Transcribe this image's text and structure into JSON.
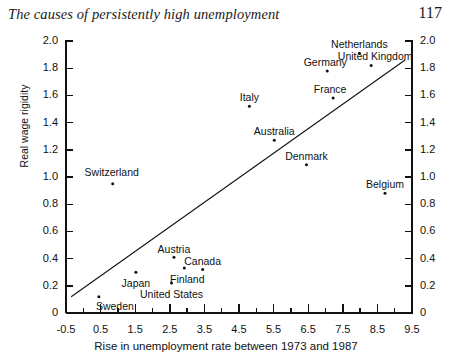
{
  "page": {
    "running_head": "The causes of persistently high unemployment",
    "folio": "117"
  },
  "chart_data": {
    "type": "scatter",
    "title": "",
    "xlabel": "Rise in unemployment rate between 1973 and 1987",
    "ylabel": "Real wage rigidity",
    "xlim": [
      -0.5,
      9.5
    ],
    "ylim": [
      0,
      2.0
    ],
    "xticks": [
      -0.5,
      0.5,
      1.5,
      2.5,
      3.5,
      4.5,
      5.5,
      6.5,
      7.5,
      8.5,
      9.5
    ],
    "xticklabels": [
      "-0.5",
      "0.5",
      "1.5",
      "2.5",
      "3.5",
      "4.5",
      "5.5",
      "6.5",
      "7.5",
      "8.5",
      "9.5"
    ],
    "xminor_step": 0.5,
    "yticks": [
      0,
      0.2,
      0.4,
      0.6,
      0.8,
      1.0,
      1.2,
      1.4,
      1.6,
      1.8,
      2.0
    ],
    "yticklabels": [
      "0",
      "0.2",
      "0.4",
      "0.6",
      "0.8",
      "1.0",
      "1.2",
      "1.4",
      "1.6",
      "1.8",
      "2.0"
    ],
    "y_axis_right_mirrored": true,
    "grid": false,
    "legend": "none",
    "trendline": {
      "x0": -0.35,
      "y0": 0.12,
      "x1": 9.3,
      "y1": 1.86
    },
    "points": [
      {
        "name": "Sweden",
        "x": 0.45,
        "y": 0.12,
        "label_dx": 16,
        "label_dy": 9
      },
      {
        "name": "Switzerland",
        "x": 0.85,
        "y": 0.95,
        "label_dx": -1,
        "label_dy": -12
      },
      {
        "name": "Japan",
        "x": 1.52,
        "y": 0.3,
        "label_dx": 0,
        "label_dy": 11
      },
      {
        "name": "United States",
        "x": 2.55,
        "y": 0.22,
        "label_dx": 0,
        "label_dy": 11
      },
      {
        "name": "Austria",
        "x": 2.62,
        "y": 0.41,
        "label_dx": 0,
        "label_dy": -8
      },
      {
        "name": "Finland",
        "x": 2.92,
        "y": 0.33,
        "label_dx": 3,
        "label_dy": 11
      },
      {
        "name": "Canada",
        "x": 3.45,
        "y": 0.32,
        "label_dx": 0,
        "label_dy": -8
      },
      {
        "name": "Italy",
        "x": 4.8,
        "y": 1.52,
        "label_dx": 0,
        "label_dy": -9
      },
      {
        "name": "Australia",
        "x": 5.52,
        "y": 1.27,
        "label_dx": 0,
        "label_dy": -9
      },
      {
        "name": "Denmark",
        "x": 6.45,
        "y": 1.09,
        "label_dx": 0,
        "label_dy": -9
      },
      {
        "name": "Germany",
        "x": 7.05,
        "y": 1.78,
        "label_dx": -2,
        "label_dy": -9
      },
      {
        "name": "France",
        "x": 7.22,
        "y": 1.58,
        "label_dx": -3,
        "label_dy": -9
      },
      {
        "name": "Netherlands",
        "x": 7.98,
        "y": 1.91,
        "label_dx": 0,
        "label_dy": -9
      },
      {
        "name": "United Kingdom",
        "x": 8.32,
        "y": 1.82,
        "label_dx": 4,
        "label_dy": -9
      },
      {
        "name": "Belgium",
        "x": 8.72,
        "y": 0.88,
        "label_dx": 0,
        "label_dy": -9
      }
    ]
  }
}
